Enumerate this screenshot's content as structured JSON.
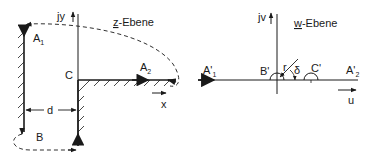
{
  "z_plane": {
    "title_underlined": "z",
    "title_rest": "-Ebene",
    "axis_y_label": "jy",
    "axis_x_label": "x",
    "points": {
      "A1": {
        "base": "A",
        "sub": "1"
      },
      "A2": {
        "base": "A",
        "sub": "2"
      },
      "B": "B",
      "C": "C"
    },
    "dimension_label": "d"
  },
  "w_plane": {
    "title_underlined": "w",
    "title_rest": "-Ebene",
    "axis_y_label": "jv",
    "axis_x_label": "u",
    "points": {
      "A1p": {
        "base": "A'",
        "sub": "1"
      },
      "A2p": {
        "base": "A'",
        "sub": "2"
      },
      "Bp": "B'",
      "Cp": "C'"
    },
    "radius_label": "r",
    "angle_label": "δ"
  },
  "colors": {
    "stroke": "#1a1a1a",
    "background": "#ffffff"
  }
}
